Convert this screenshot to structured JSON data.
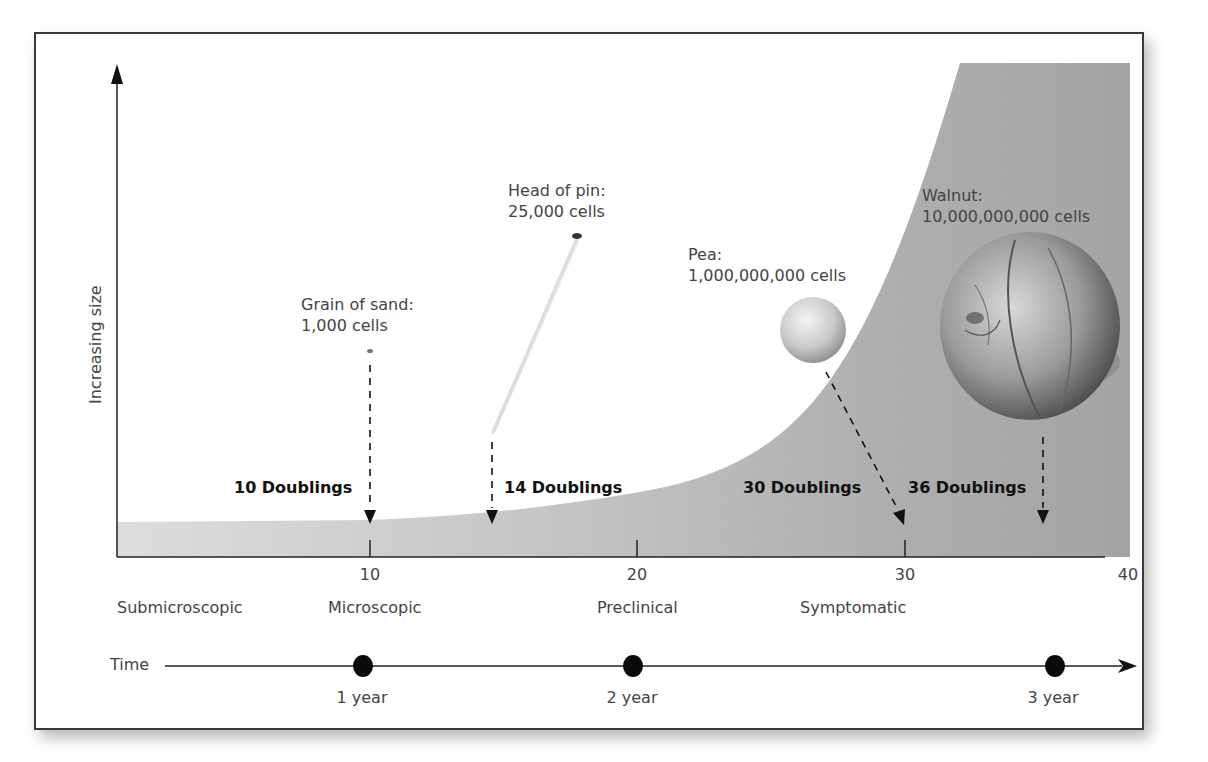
{
  "diagram": {
    "y_axis_label": "Increasing size",
    "x_ticks": [
      "10",
      "20",
      "30",
      "40"
    ],
    "stages": [
      "Submicroscopic",
      "Microscopic",
      "Preclinical",
      "Symptomatic"
    ],
    "timeline": {
      "label": "Time",
      "markers": [
        "1 year",
        "2 year",
        "3 year"
      ]
    },
    "objects": [
      {
        "name": "Grain of sand:",
        "cells": "1,000 cells",
        "doublings": "10 Doublings"
      },
      {
        "name": "Head of pin:",
        "cells": "25,000 cells",
        "doublings": "14 Doublings"
      },
      {
        "name": "Pea:",
        "cells": "1,000,000,000 cells",
        "doublings": "30 Doublings"
      },
      {
        "name": "Walnut:",
        "cells": "10,000,000,000 cells",
        "doublings": "36 Doublings"
      }
    ],
    "colors": {
      "curve_fill": "#a8a8a8",
      "curve_fill_light": "#d4d4d4",
      "axis": "#222222",
      "frame": "#3a3a3a"
    }
  }
}
